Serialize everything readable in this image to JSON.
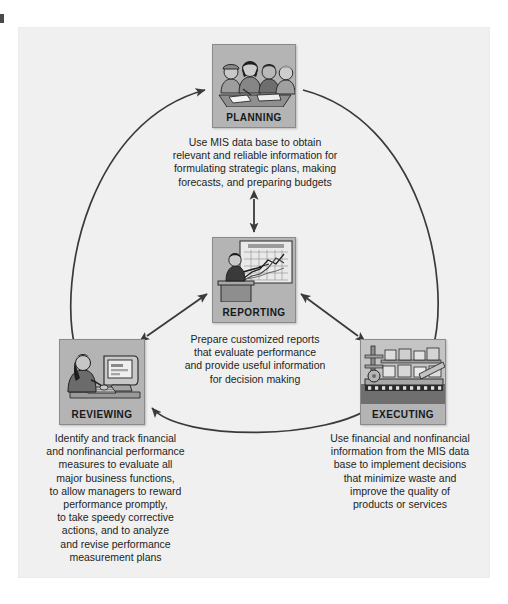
{
  "figure": {
    "type": "cycle-diagram",
    "title": "",
    "background_color": "#f0f0f0",
    "node_fill_color": "#b4b4b4",
    "line_color": "#3a3a3a"
  },
  "nodes": [
    {
      "id": "planning",
      "label": "Planning",
      "icon": "meeting-people-icon",
      "position": "top",
      "caption": "Use MIS data base to obtain\nrelevant and reliable information for\nformulating strategic plans, making\nforecasts, and preparing budgets"
    },
    {
      "id": "reporting",
      "label": "Reporting",
      "icon": "presenter-podium-chart-icon",
      "position": "center",
      "caption": "Prepare customized reports\nthat evaluate performance\nand provide useful information\nfor decision making"
    },
    {
      "id": "reviewing",
      "label": "Reviewing",
      "icon": "person-at-computer-icon",
      "position": "bottom-left",
      "caption": "Identify and track financial\nand nonfinancial performance\nmeasures to evaluate all\nmajor business functions,\nto allow managers to reward\nperformance promptly,\nto take speedy corrective\nactions, and to analyze\nand revise performance\nmeasurement plans"
    },
    {
      "id": "executing",
      "label": "Executing",
      "icon": "factory-conveyor-icon",
      "position": "bottom-right",
      "caption": "Use financial and nonfinancial\ninformation from the MIS data\nbase to implement decisions\nthat minimize waste and\nimprove the quality of\nproducts or services"
    }
  ],
  "connections": [
    {
      "from": "reviewing",
      "to": "planning",
      "style": "arc",
      "direction": "one-way"
    },
    {
      "from": "planning",
      "to": "executing",
      "style": "arc",
      "direction": "one-way"
    },
    {
      "from": "executing",
      "to": "reviewing",
      "style": "arc",
      "direction": "one-way"
    },
    {
      "from": "planning",
      "to": "reporting",
      "style": "straight",
      "direction": "two-way"
    },
    {
      "from": "reviewing",
      "to": "reporting",
      "style": "straight",
      "direction": "two-way"
    },
    {
      "from": "executing",
      "to": "reporting",
      "style": "straight",
      "direction": "two-way"
    }
  ],
  "reporting_chart": {
    "header": "PERFORMANCE",
    "type": "line",
    "series_count": 3,
    "grid": true
  }
}
